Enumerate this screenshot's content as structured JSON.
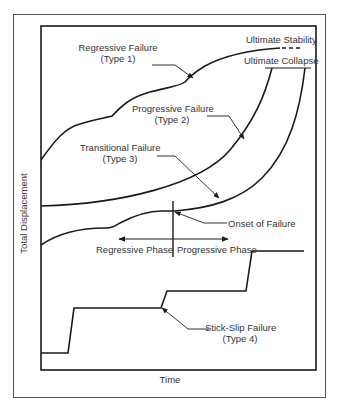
{
  "figure": {
    "x_axis_label": "Time",
    "y_axis_label": "Total Displacement",
    "annotations": {
      "type1_line1": "Regressive Failure",
      "type1_line2": "(Type 1)",
      "type2_line1": "Progressive Failure",
      "type2_line2": "(Type 2)",
      "type3_line1": "Transitional Failure",
      "type3_line2": "(Type 3)",
      "type4_line1": "Stick-Slip Failure",
      "type4_line2": "(Type 4)",
      "ultimate_stability": "Ultimate Stability",
      "ultimate_collapse": "Ultimate Collapse",
      "onset_of_failure": "Onset of Failure",
      "regressive_phase": "Regressive Phase",
      "progressive_phase": "Progressive Phase"
    },
    "colors": {
      "line": "#1a1a1a",
      "text": "#333333",
      "frame": "#444444"
    }
  }
}
